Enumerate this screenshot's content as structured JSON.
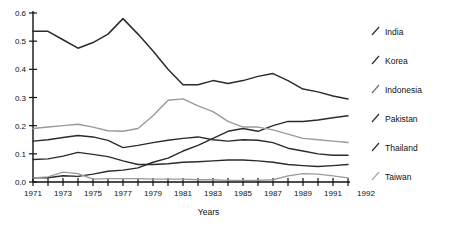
{
  "chart_data": {
    "type": "line",
    "title": "",
    "xlabel": "Years",
    "ylabel": "",
    "xlim": [
      1971,
      1992
    ],
    "ylim": [
      0.0,
      0.6
    ],
    "grid": false,
    "legend_position": "right",
    "x": [
      1971,
      1972,
      1973,
      1974,
      1975,
      1976,
      1977,
      1978,
      1979,
      1980,
      1981,
      1982,
      1983,
      1984,
      1985,
      1986,
      1987,
      1988,
      1989,
      1990,
      1991,
      1992
    ],
    "xtick_labels": [
      "1971",
      "1973",
      "1975",
      "1977",
      "1979",
      "1981",
      "1983",
      "1985",
      "1987",
      "1989",
      "1991",
      "1992"
    ],
    "xtick_values": [
      1971,
      1973,
      1975,
      1977,
      1979,
      1981,
      1983,
      1985,
      1987,
      1989,
      1991,
      1992
    ],
    "ytick_labels": [
      "0.0",
      "0.1",
      "0.2",
      "0.3",
      "0.4",
      "0.5",
      "0.6"
    ],
    "ytick_values": [
      0.0,
      0.1,
      0.2,
      0.3,
      0.4,
      0.5,
      0.6
    ],
    "series": [
      {
        "name": "India",
        "color": "#2b2b2b",
        "width": 1.5,
        "values": [
          0.535,
          0.535,
          0.505,
          0.475,
          0.495,
          0.525,
          0.58,
          0.525,
          0.465,
          0.4,
          0.345,
          0.345,
          0.36,
          0.35,
          0.36,
          0.375,
          0.385,
          0.36,
          0.33,
          0.32,
          0.305,
          0.295
        ]
      },
      {
        "name": "Korea",
        "color": "#2b2b2b",
        "width": 1.4,
        "values": [
          0.015,
          0.015,
          0.022,
          0.02,
          0.028,
          0.038,
          0.042,
          0.05,
          0.07,
          0.085,
          0.11,
          0.13,
          0.155,
          0.18,
          0.19,
          0.18,
          0.2,
          0.215,
          0.215,
          0.22,
          0.228,
          0.235
        ]
      },
      {
        "name": "Indonesia",
        "color": "#9a9a9a",
        "width": 1.4,
        "values": [
          0.19,
          0.195,
          0.2,
          0.205,
          0.195,
          0.182,
          0.18,
          0.19,
          0.235,
          0.29,
          0.295,
          0.27,
          0.25,
          0.215,
          0.195,
          0.195,
          0.185,
          0.17,
          0.155,
          0.15,
          0.145,
          0.14
        ]
      },
      {
        "name": "Pakistan",
        "color": "#2b2b2b",
        "width": 1.4,
        "values": [
          0.145,
          0.15,
          0.158,
          0.165,
          0.16,
          0.148,
          0.122,
          0.13,
          0.14,
          0.148,
          0.155,
          0.16,
          0.15,
          0.145,
          0.15,
          0.148,
          0.14,
          0.12,
          0.11,
          0.1,
          0.095,
          0.095
        ]
      },
      {
        "name": "Thailand",
        "color": "#2b2b2b",
        "width": 1.4,
        "values": [
          0.08,
          0.082,
          0.092,
          0.105,
          0.098,
          0.09,
          0.075,
          0.062,
          0.062,
          0.065,
          0.07,
          0.072,
          0.075,
          0.078,
          0.078,
          0.075,
          0.07,
          0.062,
          0.058,
          0.055,
          0.058,
          0.062
        ]
      },
      {
        "name": "Taiwan",
        "color": "#9a9a9a",
        "width": 1.3,
        "values": [
          0.015,
          0.018,
          0.035,
          0.03,
          0.01,
          0.012,
          0.012,
          0.012,
          0.01,
          0.01,
          0.01,
          0.008,
          0.008,
          0.006,
          0.006,
          0.006,
          0.008,
          0.022,
          0.03,
          0.028,
          0.022,
          0.015
        ]
      }
    ]
  },
  "legend": {
    "items": [
      {
        "label": "India",
        "marker": "diagonal-slash-icon",
        "color": "#2b2b2b"
      },
      {
        "label": "Korea",
        "marker": "diagonal-slash-icon",
        "color": "#2b2b2b"
      },
      {
        "label": "Indonesia",
        "marker": "diagonal-slash-icon",
        "color": "#6d6d6d"
      },
      {
        "label": "Pakistan",
        "marker": "diagonal-slash-icon",
        "color": "#2b2b2b"
      },
      {
        "label": "Thailand",
        "marker": "diagonal-slash-icon",
        "color": "#2b2b2b"
      },
      {
        "label": "Taiwan",
        "marker": "diagonal-slash-icon",
        "color": "#a8a8a8"
      }
    ]
  }
}
